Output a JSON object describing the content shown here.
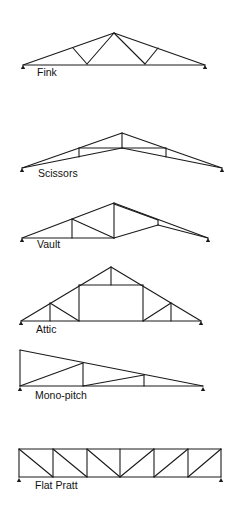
{
  "diagram": {
    "colors": {
      "line": "#1a1a1a",
      "background": "#ffffff"
    },
    "trusses": [
      {
        "name": "Fink",
        "label": "Fink",
        "label_pos": [
          37,
          76
        ],
        "supports": [
          [
            23,
            65
          ],
          [
            205,
            65
          ]
        ],
        "members": [
          [
            23,
            65,
            114,
            33
          ],
          [
            114,
            33,
            205,
            65
          ],
          [
            23,
            65,
            205,
            65
          ],
          [
            73,
            48,
            87,
            64
          ],
          [
            87,
            64,
            114,
            33
          ],
          [
            114,
            33,
            145,
            64
          ],
          [
            145,
            64,
            158,
            48
          ]
        ]
      },
      {
        "name": "Scissors",
        "label": "Scissors",
        "label_pos": [
          38,
          177
        ],
        "supports": [
          [
            22,
            168
          ],
          [
            222,
            168
          ]
        ],
        "members": [
          [
            22,
            168,
            122,
            133
          ],
          [
            122,
            133,
            222,
            168
          ],
          [
            22,
            168,
            122,
            148
          ],
          [
            122,
            148,
            222,
            168
          ],
          [
            122,
            133,
            122,
            148
          ],
          [
            79,
            148,
            79,
            157
          ],
          [
            79,
            148,
            166,
            148
          ],
          [
            166,
            148,
            166,
            157
          ]
        ]
      },
      {
        "name": "Vault",
        "label": "Vault",
        "label_pos": [
          37,
          248
        ],
        "supports": [
          [
            22,
            238
          ],
          [
            208,
            238
          ]
        ],
        "members": [
          [
            22,
            238,
            114,
            203
          ],
          [
            114,
            203,
            208,
            238
          ],
          [
            22,
            238,
            114,
            238
          ],
          [
            114,
            238,
            158,
            225
          ],
          [
            158,
            225,
            208,
            238
          ],
          [
            72,
            219,
            72,
            238
          ],
          [
            72,
            219,
            114,
            238
          ],
          [
            114,
            203,
            114,
            238
          ],
          [
            114,
            204,
            158,
            220
          ],
          [
            158,
            220,
            158,
            225
          ]
        ]
      },
      {
        "name": "Attic",
        "label": "Attic",
        "label_pos": [
          36,
          333
        ],
        "supports": [
          [
            21,
            321
          ],
          [
            201,
            321
          ]
        ],
        "members": [
          [
            21,
            321,
            111,
            267
          ],
          [
            111,
            267,
            201,
            321
          ],
          [
            21,
            321,
            201,
            321
          ],
          [
            111,
            267,
            111,
            285
          ],
          [
            79,
            285,
            143,
            285
          ],
          [
            79,
            285,
            79,
            321
          ],
          [
            143,
            285,
            143,
            321
          ],
          [
            50,
            303,
            50,
            321
          ],
          [
            50,
            303,
            79,
            321
          ],
          [
            171,
            303,
            171,
            321
          ],
          [
            143,
            321,
            171,
            303
          ]
        ]
      },
      {
        "name": "Mono-pitch",
        "label": "Mono-pitch",
        "label_pos": [
          35,
          399
        ],
        "supports": [
          [
            20,
            387
          ],
          [
            203,
            387
          ]
        ],
        "members": [
          [
            20,
            350,
            20,
            386
          ],
          [
            20,
            350,
            203,
            386
          ],
          [
            20,
            386,
            203,
            386
          ],
          [
            83,
            363,
            83,
            386
          ],
          [
            20,
            386,
            83,
            363
          ],
          [
            144,
            375,
            144,
            386
          ],
          [
            83,
            386,
            144,
            375
          ]
        ]
      },
      {
        "name": "Flat Pratt",
        "label": "Flat Pratt",
        "label_pos": [
          35,
          489
        ],
        "supports": [
          [
            19,
            478
          ],
          [
            221,
            478
          ]
        ],
        "members": [
          [
            19,
            449,
            221,
            449
          ],
          [
            19,
            477,
            221,
            477
          ],
          [
            19,
            449,
            19,
            477
          ],
          [
            53,
            449,
            53,
            477
          ],
          [
            87,
            449,
            87,
            477
          ],
          [
            120,
            449,
            120,
            477
          ],
          [
            154,
            449,
            154,
            477
          ],
          [
            188,
            449,
            188,
            477
          ],
          [
            221,
            449,
            221,
            477
          ],
          [
            19,
            449,
            53,
            477
          ],
          [
            53,
            449,
            87,
            477
          ],
          [
            87,
            449,
            120,
            477
          ],
          [
            120,
            477,
            154,
            449
          ],
          [
            154,
            477,
            188,
            449
          ],
          [
            188,
            477,
            221,
            449
          ]
        ]
      }
    ]
  }
}
